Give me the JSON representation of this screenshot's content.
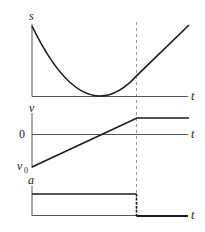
{
  "diagram": {
    "type": "kinematics-graphs",
    "panels": [
      {
        "id": "position",
        "y_label": "s",
        "x_label": "t",
        "curve": "parabola decreasing to a minimum touching the t-axis, then increasing; becomes a straight line after the dashed time marker"
      },
      {
        "id": "velocity",
        "y_label": "v",
        "x_label": "t",
        "zero_label": "0",
        "initial_label": "v",
        "initial_label_sub": "0",
        "curve": "linear increase from v0 (negative) through 0, then constant after the dashed time marker"
      },
      {
        "id": "acceleration",
        "y_label": "a",
        "x_label": "t",
        "curve": "constant positive acceleration, drops to zero at the dashed time marker"
      }
    ],
    "marker": {
      "style": "dashed vertical line",
      "meaning": "time when acceleration stops"
    },
    "colors": {
      "curve": "#1a1a1a",
      "axis": "#555555",
      "marker": "#9a9a9a"
    }
  }
}
